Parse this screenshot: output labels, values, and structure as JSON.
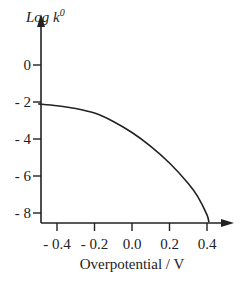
{
  "chart_data": {
    "type": "line",
    "title": "",
    "xlabel": "Overpotential / V",
    "ylabel": "Log k",
    "ylabel_superscript": "0",
    "xlim": [
      -0.5,
      0.5
    ],
    "ylim": [
      -8.5,
      1
    ],
    "x_ticks": [
      -0.4,
      -0.2,
      0.0,
      0.2,
      0.4
    ],
    "x_tick_labels": [
      "- 0.4",
      "- 0.2",
      "0.0",
      "0.2",
      "0.4"
    ],
    "y_ticks": [
      0,
      -2,
      -4,
      -6,
      -8
    ],
    "y_tick_labels": [
      "0",
      "- 2",
      "- 4",
      "- 6",
      "- 8"
    ],
    "grid": false,
    "legend": "none",
    "series": [
      {
        "name": "log k0 vs overpotential",
        "color": "#222222",
        "x": [
          -0.5,
          -0.4,
          -0.3,
          -0.2,
          -0.1,
          0.0,
          0.1,
          0.2,
          0.3,
          0.35,
          0.4,
          0.41
        ],
        "y": [
          -2.1,
          -2.2,
          -2.35,
          -2.6,
          -3.05,
          -3.65,
          -4.4,
          -5.3,
          -6.4,
          -7.1,
          -8.1,
          -8.5
        ]
      }
    ]
  }
}
